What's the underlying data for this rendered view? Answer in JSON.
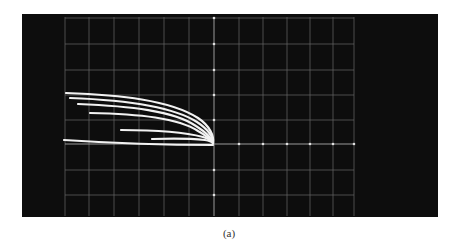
{
  "figure": {
    "caption": "(a)",
    "colors": {
      "background": "#ffffff",
      "screen": "#0d0d0d",
      "grid": "#8a8a8a",
      "trace": "#f2f2f2",
      "caption": "#333333"
    },
    "graticule": {
      "columns": 12,
      "rows": 8,
      "center_axes_with_tick_dots": true
    },
    "traces": [
      {
        "name": "trace-1",
        "start": [
          66,
          93
        ],
        "end": [
          213,
          143
        ]
      },
      {
        "name": "trace-2",
        "start": [
          70,
          98
        ],
        "end": [
          213,
          143
        ]
      },
      {
        "name": "trace-3",
        "start": [
          78,
          104
        ],
        "end": [
          213,
          143
        ]
      },
      {
        "name": "trace-4",
        "start": [
          90,
          113
        ],
        "end": [
          213,
          143
        ]
      },
      {
        "name": "trace-5",
        "start": [
          121,
          130
        ],
        "end": [
          213,
          143
        ]
      },
      {
        "name": "trace-6",
        "start": [
          152,
          139
        ],
        "end": [
          213,
          143
        ]
      },
      {
        "name": "trace-bottom",
        "start": [
          64,
          140
        ],
        "end": [
          213,
          145
        ]
      }
    ]
  }
}
